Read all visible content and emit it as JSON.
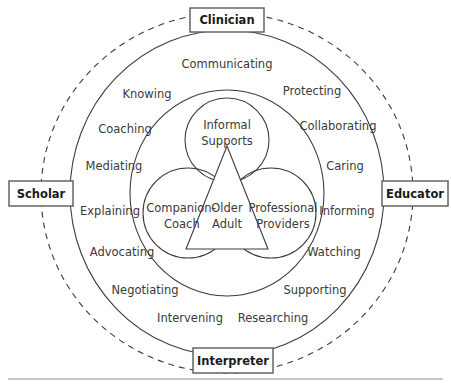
{
  "diagram": {
    "colors": {
      "stroke": "#3c3c3c",
      "box_stroke": "#5a5a5a",
      "text": "#3a3a3a",
      "anchor_text": "#1a1a1a",
      "background": "#ffffff",
      "rule": "#8c8c8c"
    },
    "anchors": [
      {
        "id": "clinician",
        "label": "Clinician",
        "position": "top"
      },
      {
        "id": "scholar",
        "label": "Scholar",
        "position": "left"
      },
      {
        "id": "educator",
        "label": "Educator",
        "position": "right"
      },
      {
        "id": "interpreter",
        "label": "Interpreter",
        "position": "bottom"
      }
    ],
    "core_circles": [
      {
        "id": "informal-supports",
        "line1": "Informal",
        "line2": "Supports",
        "position": "top"
      },
      {
        "id": "companion-coach",
        "line1": "Companion-",
        "line2": "Coach",
        "position": "bottom-left"
      },
      {
        "id": "professional-providers",
        "line1": "Professional",
        "line2": "Providers",
        "position": "bottom-right"
      }
    ],
    "center": {
      "id": "older-adult",
      "line1": "Older",
      "line2": "Adult",
      "shape": "triangle"
    },
    "verbs_left": [
      {
        "id": "knowing",
        "label": "Knowing"
      },
      {
        "id": "coaching",
        "label": "Coaching"
      },
      {
        "id": "mediating",
        "label": "Mediating"
      },
      {
        "id": "explaining",
        "label": "Explaining"
      },
      {
        "id": "advocating",
        "label": "Advocating"
      },
      {
        "id": "negotiating",
        "label": "Negotiating"
      },
      {
        "id": "intervening",
        "label": "Intervening"
      }
    ],
    "verbs_right": [
      {
        "id": "protecting",
        "label": "Protecting"
      },
      {
        "id": "collaborating",
        "label": "Collaborating"
      },
      {
        "id": "caring",
        "label": "Caring"
      },
      {
        "id": "informing",
        "label": "Informing"
      },
      {
        "id": "watching",
        "label": "Watching"
      },
      {
        "id": "supporting",
        "label": "Supporting"
      },
      {
        "id": "researching",
        "label": "Researching"
      }
    ],
    "verbs_top": [
      {
        "id": "communicating",
        "label": "Communicating"
      }
    ]
  }
}
